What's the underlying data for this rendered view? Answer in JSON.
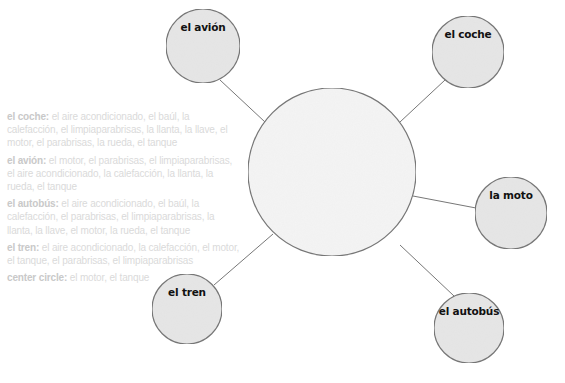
{
  "diagram": {
    "type": "word-web",
    "center": {
      "label": "",
      "cx": 332,
      "cy": 172,
      "r": 84
    },
    "nodes": [
      {
        "id": "avion",
        "label": "el avión",
        "cx": 203,
        "cy": 46,
        "r": 37,
        "line": [
          220,
          80,
          265,
          122
        ]
      },
      {
        "id": "coche",
        "label": "el coche",
        "cx": 468,
        "cy": 52,
        "r": 36,
        "line": [
          445,
          80,
          400,
          122
        ]
      },
      {
        "id": "moto",
        "label": "la moto",
        "cx": 511,
        "cy": 213,
        "r": 36,
        "line": [
          413,
          196,
          476,
          208
        ]
      },
      {
        "id": "autobus",
        "label": "el autobús",
        "cx": 469,
        "cy": 328,
        "r": 35,
        "line": [
          400,
          245,
          454,
          296
        ]
      },
      {
        "id": "tren",
        "label": "el tren",
        "cx": 187,
        "cy": 309,
        "r": 35,
        "line": [
          273,
          234,
          214,
          285
        ]
      }
    ],
    "colors": {
      "circle_fill": "#e6e6e6",
      "center_fill": "#f4f4f4",
      "stroke": "#777777"
    }
  },
  "notes": [
    {
      "label": "el coche:",
      "text": " el aire acondicionado, el baúl, la calefacción, el limpiaparabrisas, la llanta, la llave, el motor, el parabrisas, la rueda, el tanque"
    },
    {
      "label": "el avión:",
      "text": " el motor, el parabrisas, el limpiaparabrisas, el aire acondicionado, la calefacción, la llanta, la rueda, el tanque"
    },
    {
      "label": "el autobús:",
      "text": " el aire acondicionado, el baúl, la calefacción, el parabrisas, el limpiaparabrisas, la llanta, la llave, el motor, la rueda, el tanque"
    },
    {
      "label": "el tren:",
      "text": " el aire acondicionado, la calefacción, el motor, el tanque, el parabrisas, el limpiaparabrisas"
    },
    {
      "label": "center circle:",
      "text": " el motor, el tanque"
    }
  ]
}
